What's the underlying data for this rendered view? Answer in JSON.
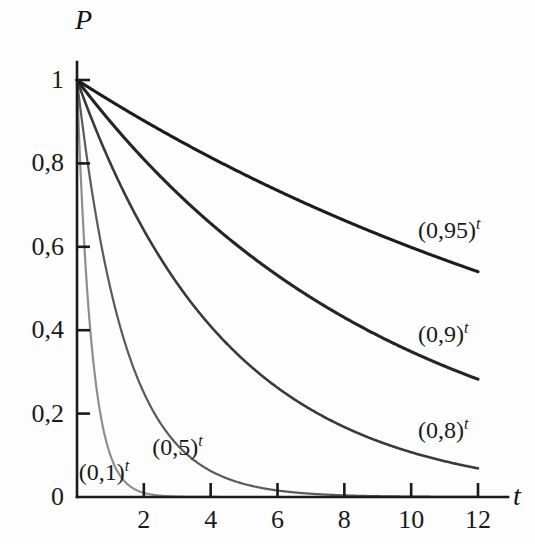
{
  "chart_data": {
    "type": "line",
    "title": "",
    "subtitle": "",
    "xlabel": "t",
    "ylabel": "P",
    "xlim": [
      0,
      12.8
    ],
    "ylim": [
      0,
      1.05
    ],
    "grid": false,
    "legend_position": "inline-annotations",
    "x_ticks": [
      "2",
      "4",
      "6",
      "8",
      "10",
      "12"
    ],
    "x_tick_values": [
      2,
      4,
      6,
      8,
      10,
      12
    ],
    "y_ticks": [
      "0",
      "0,2",
      "0,4",
      "0,6",
      "0,8",
      "1"
    ],
    "y_tick_values": [
      0,
      0.2,
      0.4,
      0.6,
      0.8,
      1
    ],
    "decimal_separator": ",",
    "x": [
      0,
      0.5,
      1,
      1.5,
      2,
      2.5,
      3,
      3.5,
      4,
      4.5,
      5,
      5.5,
      6,
      6.5,
      7,
      7.5,
      8,
      8.5,
      9,
      9.5,
      10,
      10.5,
      11,
      11.5,
      12
    ],
    "series": [
      {
        "name": "(0,95)^t",
        "base": 0.95,
        "color": "#1c1c1c",
        "values": [
          1,
          0.9747,
          0.95,
          0.926,
          0.9025,
          0.8797,
          0.8574,
          0.8356,
          0.8145,
          0.7939,
          0.7738,
          0.7542,
          0.7351,
          0.7165,
          0.6983,
          0.6807,
          0.6634,
          0.6466,
          0.6302,
          0.6143,
          0.5987,
          0.5836,
          0.5688,
          0.5544,
          0.5404
        ]
      },
      {
        "name": "(0,9)^t",
        "base": 0.9,
        "color": "#252525",
        "values": [
          1,
          0.9487,
          0.9,
          0.8538,
          0.81,
          0.7684,
          0.729,
          0.6916,
          0.6561,
          0.6224,
          0.5905,
          0.5602,
          0.5314,
          0.5041,
          0.4783,
          0.4537,
          0.4305,
          0.4084,
          0.3874,
          0.3675,
          0.3487,
          0.3308,
          0.3138,
          0.2977,
          0.2824
        ]
      },
      {
        "name": "(0,8)^t",
        "base": 0.8,
        "color": "#3a3a3a",
        "values": [
          1,
          0.8944,
          0.8,
          0.7155,
          0.64,
          0.5724,
          0.512,
          0.4579,
          0.4096,
          0.3664,
          0.3277,
          0.2931,
          0.2621,
          0.2345,
          0.2097,
          0.1876,
          0.1678,
          0.1501,
          0.1342,
          0.1201,
          0.1074,
          0.0961,
          0.0859,
          0.0768,
          0.0687
        ]
      },
      {
        "name": "(0,5)^t",
        "base": 0.5,
        "color": "#5a5a5a",
        "values": [
          1,
          0.7071,
          0.5,
          0.3536,
          0.25,
          0.1768,
          0.125,
          0.0884,
          0.0625,
          0.0442,
          0.0313,
          0.0221,
          0.0156,
          0.011,
          0.0078,
          0.0055,
          0.0039,
          0.0028,
          0.002,
          0.0014,
          0.001,
          0.0007,
          0.0005,
          0.0003,
          0.0002
        ]
      },
      {
        "name": "(0,1)^t",
        "base": 0.1,
        "color": "#8e8e8e",
        "values": [
          1,
          0.3162,
          0.1,
          0.0316,
          0.01,
          0.0032,
          0.001,
          0.0003,
          0.0001,
          3e-05,
          1e-05,
          3e-06,
          1e-06,
          0,
          0,
          0,
          0,
          0,
          0,
          0,
          0,
          0,
          0,
          0,
          0
        ]
      }
    ],
    "annotations": [
      {
        "text_base": "(0,95)",
        "exponent": "t",
        "x": 12.0,
        "y": 0.635
      },
      {
        "text_base": "(0,9)",
        "exponent": "t",
        "x": 12.0,
        "y": 0.385
      },
      {
        "text_base": "(0,8)",
        "exponent": "t",
        "x": 12.0,
        "y": 0.155
      },
      {
        "text_base": "(0,5)",
        "exponent": "t",
        "x": 4.05,
        "y": 0.115
      },
      {
        "text_base": "(0,1)",
        "exponent": "t",
        "x": 1.85,
        "y": 0.055
      }
    ]
  },
  "axes": {
    "y_label": "P",
    "x_label": "t"
  },
  "y_tick_labels": [
    {
      "text": "1",
      "value": 1
    },
    {
      "text": "0,8",
      "value": 0.8
    },
    {
      "text": "0,6",
      "value": 0.6
    },
    {
      "text": "0,4",
      "value": 0.4
    },
    {
      "text": "0,2",
      "value": 0.2
    },
    {
      "text": "0",
      "value": 0
    }
  ],
  "x_tick_labels": [
    {
      "text": "2",
      "value": 2
    },
    {
      "text": "4",
      "value": 4
    },
    {
      "text": "6",
      "value": 6
    },
    {
      "text": "8",
      "value": 8
    },
    {
      "text": "10",
      "value": 10
    },
    {
      "text": "12",
      "value": 12
    }
  ],
  "curve_labels": [
    {
      "base": "(0,95)",
      "exp": "t"
    },
    {
      "base": "(0,9)",
      "exp": "t"
    },
    {
      "base": "(0,8)",
      "exp": "t"
    },
    {
      "base": "(0,5)",
      "exp": "t"
    },
    {
      "base": "(0,1)",
      "exp": "t"
    }
  ]
}
